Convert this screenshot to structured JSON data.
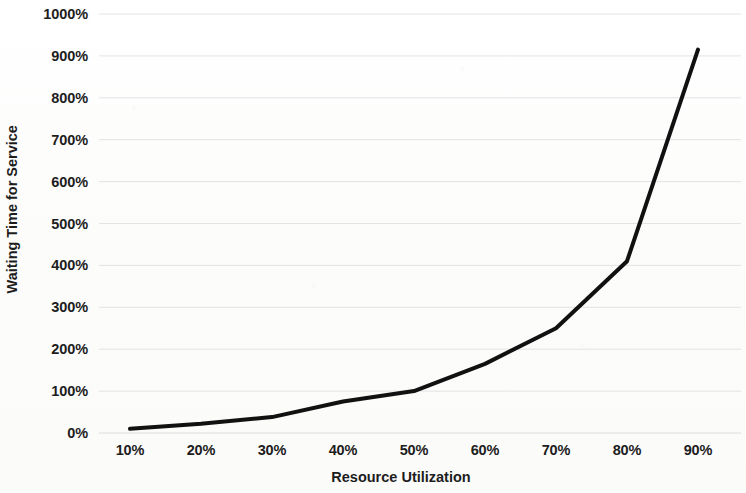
{
  "chart_data": {
    "type": "line",
    "title": "",
    "xlabel": "Resource Utilization",
    "ylabel": "Waiting Time for Service",
    "x": [
      10,
      20,
      30,
      40,
      50,
      60,
      70,
      80,
      90
    ],
    "x_tick_labels": [
      "10%",
      "20%",
      "30%",
      "40%",
      "50%",
      "60%",
      "70%",
      "80%",
      "90%"
    ],
    "y_tick_labels": [
      "0%",
      "100%",
      "200%",
      "300%",
      "400%",
      "500%",
      "600%",
      "700%",
      "800%",
      "900%",
      "1000%"
    ],
    "y_ticks": [
      0,
      100,
      200,
      300,
      400,
      500,
      600,
      700,
      800,
      900,
      1000
    ],
    "xlim": [
      10,
      90
    ],
    "ylim": [
      0,
      1000
    ],
    "grid": true,
    "grid_axis": "y",
    "legend": false,
    "legend_position": "none",
    "series": [
      {
        "name": "Waiting Time",
        "color": "#111111",
        "line_width": 4,
        "values": [
          10,
          22,
          38,
          75,
          100,
          165,
          250,
          410,
          915
        ]
      }
    ]
  },
  "axes": {
    "y_title": "Waiting Time for Service",
    "x_title": "Resource Utilization",
    "y_labels": [
      "1000%",
      "900%",
      "800%",
      "700%",
      "600%",
      "500%",
      "400%",
      "300%",
      "200%",
      "100%",
      "0%"
    ],
    "x_labels": [
      "10%",
      "20%",
      "30%",
      "40%",
      "50%",
      "60%",
      "70%",
      "80%",
      "90%"
    ]
  },
  "style": {
    "background": "#fdfdfd",
    "grid_color": "#e6e6e6",
    "line_color": "#111111",
    "text_color": "#1d1d1d"
  }
}
